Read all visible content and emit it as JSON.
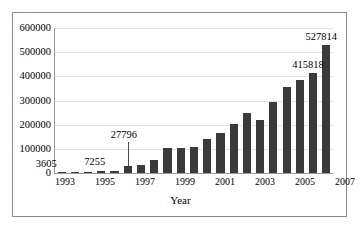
{
  "chart_data": {
    "type": "bar",
    "title": "",
    "subtitle": "",
    "xlabel": "Year",
    "ylabel": "",
    "grid": true,
    "legend": "none",
    "xlim": [
      1993,
      2013
    ],
    "ylim": [
      0,
      600000
    ],
    "ytick_labels": [
      "600000",
      "500000",
      "400000",
      "300000",
      "200000",
      "100000",
      "0"
    ],
    "ytick_values": [
      600000,
      500000,
      400000,
      300000,
      200000,
      100000,
      0
    ],
    "xtick_labels": [
      "1993",
      "1995",
      "1997",
      "1999",
      "2001",
      "2003",
      "2005",
      "2007",
      "2009",
      "2011",
      "2013"
    ],
    "categories": [
      1993,
      1994,
      1995,
      1996,
      1997,
      1998,
      1999,
      2000,
      2001,
      2002,
      2003,
      2004,
      2005,
      2006,
      2007,
      2008,
      2009,
      2010,
      2011,
      2012,
      2013
    ],
    "values": [
      3605,
      4200,
      5100,
      7255,
      9800,
      27796,
      33500,
      53000,
      105000,
      105000,
      106000,
      140000,
      165000,
      203000,
      247000,
      218000,
      292000,
      357000,
      383000,
      415818,
      527814
    ],
    "annotations": [
      {
        "label": "3605",
        "year": 1993,
        "value": 3605
      },
      {
        "label": "7255",
        "year": 1996,
        "value": 7255
      },
      {
        "label": "27796",
        "year": 1998,
        "value": 27796
      },
      {
        "label": "415818",
        "year": 2012,
        "value": 415818
      },
      {
        "label": "527814",
        "year": 2013,
        "value": 527814
      }
    ],
    "bar_color": "#3a3a3a",
    "grid_color": "#e2e2e2",
    "axis_color": "#9a9a9a"
  }
}
